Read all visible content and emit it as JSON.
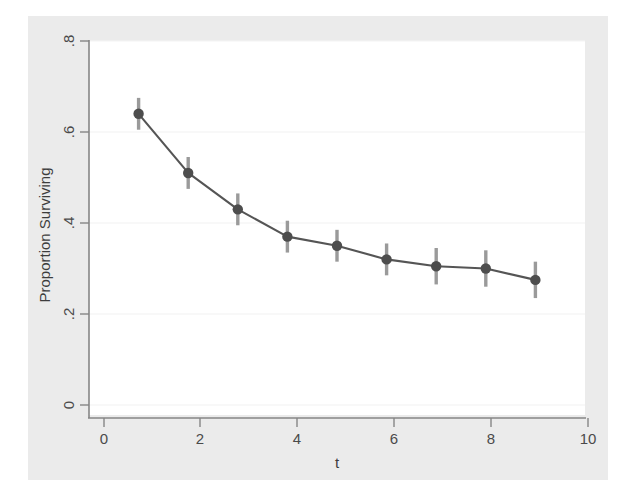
{
  "figure": {
    "background_color": "#ebebeb",
    "outer_background_color": "#ffffff",
    "plot_background_color": "#ffffff"
  },
  "chart_data": {
    "type": "line",
    "title": "",
    "subtitle": "",
    "xlabel": "t",
    "ylabel": "Proportion Surviving",
    "x": [
      1,
      2,
      3,
      4,
      5,
      6,
      7,
      8,
      9
    ],
    "values": [
      0.64,
      0.51,
      0.43,
      0.37,
      0.35,
      0.32,
      0.305,
      0.3,
      0.275
    ],
    "error_low": [
      0.605,
      0.475,
      0.395,
      0.335,
      0.315,
      0.285,
      0.265,
      0.26,
      0.235
    ],
    "error_high": [
      0.675,
      0.545,
      0.465,
      0.405,
      0.385,
      0.355,
      0.345,
      0.34,
      0.315
    ],
    "series": [
      {
        "name": "Proportion Surviving",
        "values": [
          0.64,
          0.51,
          0.43,
          0.37,
          0.35,
          0.32,
          0.305,
          0.3,
          0.275
        ]
      }
    ],
    "xlim": [
      0,
      10
    ],
    "ylim": [
      0,
      0.8
    ],
    "xticks": [
      0,
      2,
      4,
      6,
      8,
      10
    ],
    "yticks": [
      0,
      0.2,
      0.4,
      0.6,
      0.8
    ],
    "xtick_labels": [
      "0",
      "2",
      "4",
      "6",
      "8",
      "10"
    ],
    "ytick_labels": [
      "0",
      ".2",
      ".4",
      ".6",
      ".8"
    ],
    "grid": "horizontal",
    "legend": "none",
    "marker": "circle",
    "line_color": "#555555",
    "marker_color": "#4d4d4d",
    "errorbar_color": "#9a9a9a",
    "grid_color": "#f3f3f3",
    "axis_color": "#7a7a7a"
  },
  "axes": {
    "y_labels": {
      "t0": "0",
      "t1": ".2",
      "t2": ".4",
      "t3": ".6",
      "t4": ".8"
    },
    "x_labels": {
      "t0": "0",
      "t1": "2",
      "t2": "4",
      "t3": "6",
      "t4": "8",
      "t5": "10"
    },
    "y_title": "Proportion Surviving",
    "x_title": "t"
  }
}
